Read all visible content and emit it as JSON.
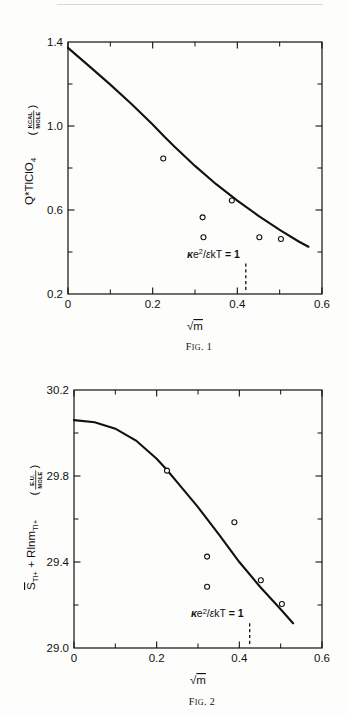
{
  "document": {
    "page_background": "#fdfdfb",
    "ink_color": "#111111"
  },
  "figures": [
    {
      "id": "fig1",
      "caption_prefix": "F",
      "caption_smallcaps": "IG",
      "caption": "FIG. 1",
      "caption_number": ". 1",
      "ylabel_main": "Q*",
      "ylabel_species": "TlClO",
      "ylabel_species_sub": "4",
      "ylabel_unit_num": "KCAL",
      "ylabel_unit_den": "MOLE",
      "xlabel": "√m",
      "annotation": "κe²/εkT = 1",
      "annotation_parts": {
        "kappa": "κ",
        "e": "e",
        "exp": "2",
        "slash": "/",
        "epsilon": "ε",
        "kT": "kT",
        "equals": "= 1"
      },
      "chart_data": {
        "type": "scatter",
        "title": "FIG. 1",
        "xlabel": "√m",
        "ylabel": "Q*TlClO4 (KCAL/MOLE)",
        "xlim": [
          0,
          0.6
        ],
        "ylim": [
          0.2,
          1.4
        ],
        "xticks": [
          0,
          0.2,
          0.4,
          0.6
        ],
        "xticklabels": [
          "0",
          "0.2",
          "0.4",
          "0.6"
        ],
        "xticks_minor": [
          0.1,
          0.3,
          0.5
        ],
        "yticks": [
          0.2,
          0.6,
          1.0,
          1.4
        ],
        "yticklabels": [
          "0.2",
          "0.6",
          "1.0",
          "1.4"
        ],
        "yticks_minor": [
          0.4,
          0.8,
          1.2
        ],
        "grid": false,
        "legend": null,
        "points": [
          {
            "x": 0.225,
            "y": 0.845
          },
          {
            "x": 0.318,
            "y": 0.565
          },
          {
            "x": 0.32,
            "y": 0.47
          },
          {
            "x": 0.387,
            "y": 0.645
          },
          {
            "x": 0.452,
            "y": 0.47
          },
          {
            "x": 0.503,
            "y": 0.462
          }
        ],
        "curve": [
          {
            "x": 0.0,
            "y": 1.372
          },
          {
            "x": 0.05,
            "y": 1.285
          },
          {
            "x": 0.1,
            "y": 1.197
          },
          {
            "x": 0.15,
            "y": 1.105
          },
          {
            "x": 0.2,
            "y": 1.007
          },
          {
            "x": 0.225,
            "y": 0.955
          },
          {
            "x": 0.25,
            "y": 0.905
          },
          {
            "x": 0.3,
            "y": 0.81
          },
          {
            "x": 0.35,
            "y": 0.723
          },
          {
            "x": 0.4,
            "y": 0.645
          },
          {
            "x": 0.45,
            "y": 0.572
          },
          {
            "x": 0.5,
            "y": 0.505
          },
          {
            "x": 0.545,
            "y": 0.45
          },
          {
            "x": 0.568,
            "y": 0.425
          }
        ],
        "annotations": [
          {
            "text": "κe²/εkT = 1",
            "x": 0.42,
            "type": "vertical-dashed-line",
            "line_ytop": 0.345,
            "line_ybottom": 0.213
          }
        ]
      }
    },
    {
      "id": "fig2",
      "caption": "FIG. 2",
      "caption_number": ". 2",
      "ylabel_sbar": "S",
      "ylabel_sbar_sub": "Tl+",
      "ylabel_mid": " + Rlnm",
      "ylabel_mid_sub": "Tl+",
      "ylabel_unit_num": "E.U.",
      "ylabel_unit_den": "MOLE",
      "xlabel": "√m",
      "annotation": "κe²/εkT = 1",
      "chart_data": {
        "type": "scatter",
        "title": "FIG. 2",
        "xlabel": "√m",
        "ylabel": "S̅Tl+ + RlnmTl+ (E.U./MOLE)",
        "xlim": [
          0,
          0.6
        ],
        "ylim": [
          29.0,
          30.2
        ],
        "xticks": [
          0,
          0.2,
          0.4,
          0.6
        ],
        "xticklabels": [
          "0",
          "0.2",
          "0.4",
          "0.6"
        ],
        "xticks_minor": [
          0.1,
          0.3,
          0.5
        ],
        "yticks": [
          29.0,
          29.4,
          29.8,
          30.2
        ],
        "yticklabels": [
          "29.0",
          "29.4",
          "29.8",
          "30.2"
        ],
        "yticks_minor": [
          29.2,
          29.6,
          30.0
        ],
        "grid": false,
        "legend": null,
        "points": [
          {
            "x": 0.225,
            "y": 29.825
          },
          {
            "x": 0.322,
            "y": 29.425
          },
          {
            "x": 0.322,
            "y": 29.285
          },
          {
            "x": 0.388,
            "y": 29.585
          },
          {
            "x": 0.452,
            "y": 29.315
          },
          {
            "x": 0.503,
            "y": 29.205
          }
        ],
        "curve": [
          {
            "x": 0.0,
            "y": 30.06
          },
          {
            "x": 0.05,
            "y": 30.05
          },
          {
            "x": 0.1,
            "y": 30.02
          },
          {
            "x": 0.15,
            "y": 29.965
          },
          {
            "x": 0.2,
            "y": 29.88
          },
          {
            "x": 0.225,
            "y": 29.828
          },
          {
            "x": 0.25,
            "y": 29.77
          },
          {
            "x": 0.3,
            "y": 29.655
          },
          {
            "x": 0.35,
            "y": 29.53
          },
          {
            "x": 0.4,
            "y": 29.4
          },
          {
            "x": 0.45,
            "y": 29.285
          },
          {
            "x": 0.5,
            "y": 29.18
          },
          {
            "x": 0.53,
            "y": 29.115
          }
        ],
        "annotations": [
          {
            "text": "κe²/εkT = 1",
            "x": 0.425,
            "type": "vertical-dashed-line",
            "line_ytop": 29.115,
            "line_ybottom": 29.012
          }
        ]
      }
    }
  ]
}
